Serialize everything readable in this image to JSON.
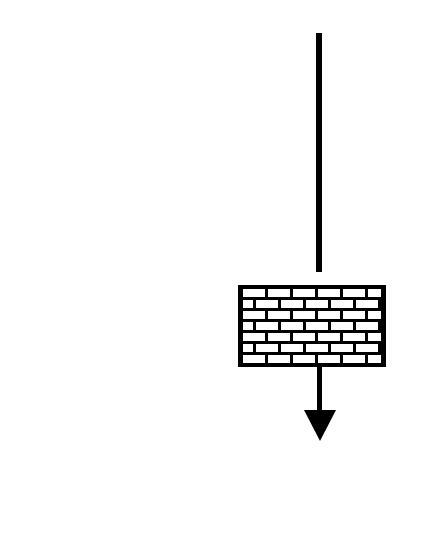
{
  "canvas": {
    "width": 422,
    "height": 555,
    "background_color": "#ffffff"
  },
  "colors": {
    "ink": "#000000",
    "mortar": "#000000",
    "brick_face": "#ffffff",
    "paper": "#ffffff"
  },
  "diagram": {
    "type": "line-drawing",
    "elements": [
      {
        "name": "incoming-arrow-shaft",
        "shape": "line",
        "x": 319,
        "y1": 33,
        "y2": 272,
        "stroke_width": 6
      },
      {
        "name": "brick-wall",
        "shape": "rectangle",
        "x": 238,
        "y": 285,
        "width": 148,
        "height": 82,
        "border_width": 5,
        "rows": 7,
        "bond": "running-bond",
        "brick_unit_width": 25,
        "mortar_width": 3
      },
      {
        "name": "outgoing-arrow-shaft",
        "shape": "line",
        "x": 319,
        "y1": 367,
        "y2": 414,
        "stroke_width": 5
      },
      {
        "name": "arrow-head",
        "shape": "triangle",
        "direction": "down",
        "left_x": 304,
        "right_x": 336,
        "top_y": 410,
        "tip_x": 320,
        "tip_y": 441
      }
    ]
  },
  "brick_rows": [
    {
      "row": 1,
      "offset": 0
    },
    {
      "row": 2,
      "offset": 1
    },
    {
      "row": 3,
      "offset": 0
    },
    {
      "row": 4,
      "offset": 1
    },
    {
      "row": 5,
      "offset": 0
    },
    {
      "row": 6,
      "offset": 1
    },
    {
      "row": 7,
      "offset": 0
    }
  ]
}
